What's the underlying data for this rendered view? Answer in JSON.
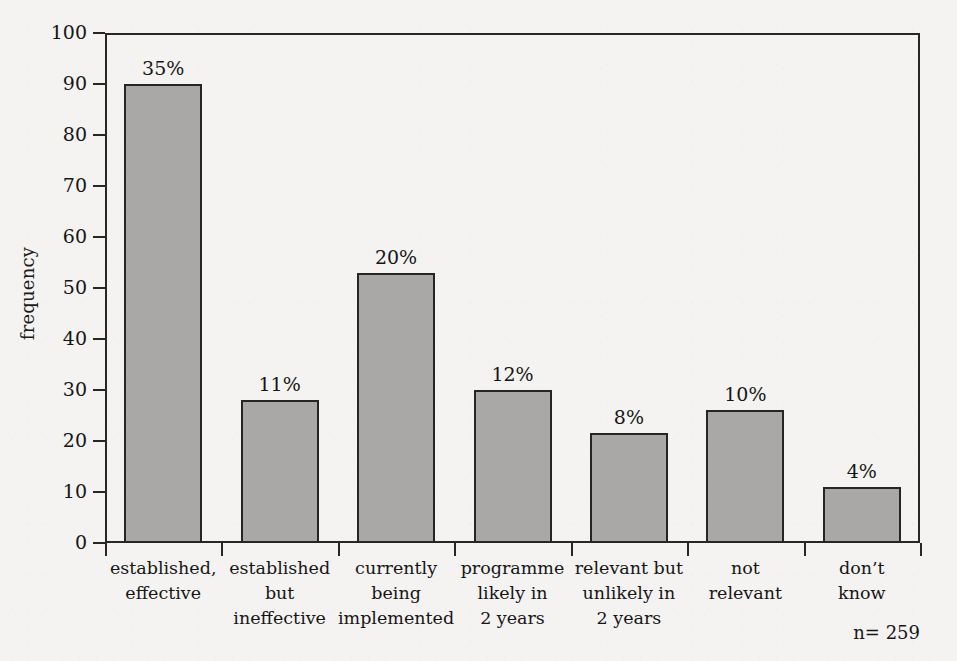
{
  "chart_data": {
    "type": "bar",
    "title": "",
    "xlabel": "",
    "ylabel": "frequency",
    "ylim": [
      0,
      100
    ],
    "yticks": [
      "0",
      "10",
      "20",
      "30",
      "40",
      "50",
      "60",
      "70",
      "80",
      "90",
      "100"
    ],
    "grid": false,
    "legend": null,
    "annotation": "n= 259",
    "categories": [
      "established, effective",
      "established but ineffective",
      "currently being implemented",
      "programme likely in 2 years",
      "relevant but unlikely in 2 years",
      "not relevant",
      "don't know"
    ],
    "category_lines": [
      [
        "established,",
        "effective"
      ],
      [
        "established",
        "but",
        "ineffective"
      ],
      [
        "currently",
        "being",
        "implemented"
      ],
      [
        "programme",
        "likely in",
        "2 years"
      ],
      [
        "relevant but",
        "unlikely in",
        "2 years"
      ],
      [
        "not",
        "relevant"
      ],
      [
        "don’t",
        "know"
      ]
    ],
    "values": [
      90,
      28,
      53,
      30,
      21.5,
      26,
      11
    ],
    "data_labels": [
      "35%",
      "11%",
      "20%",
      "12%",
      "8%",
      "10%",
      "4%"
    ],
    "colors": {
      "bar_fill": "#a9a8a6",
      "bar_stroke": "#252525",
      "axis": "#272727",
      "text": "#161616",
      "background": "#f4f3f1"
    }
  }
}
